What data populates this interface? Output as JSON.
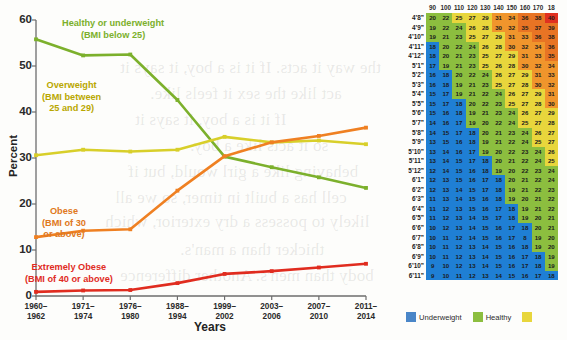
{
  "chart_data": {
    "type": "line",
    "title": "",
    "xlabel": "Years",
    "ylabel": "Percent",
    "ylim": [
      0,
      60
    ],
    "yticks": [
      0,
      10,
      20,
      30,
      40,
      50,
      60
    ],
    "grid": false,
    "legend_position": "inline-annotations",
    "categories": [
      "1960–1962",
      "1971–1974",
      "1976–1980",
      "1988–1994",
      "1999–2002",
      "2003–2006",
      "2007–2010",
      "2011–2014"
    ],
    "series": [
      {
        "name": "Healthy or underweight",
        "annotation": "Healthy or underweight",
        "annotation_sub": "(BMI below 25)",
        "color": "#7cb02c",
        "values": [
          55.8,
          52.3,
          52.5,
          42.6,
          30.3,
          28.0,
          25.8,
          23.5
        ]
      },
      {
        "name": "Overweight",
        "annotation": "Overweight",
        "annotation_sub": "(BMI between\n25 and 29)",
        "color": "#d8cf2a",
        "values": [
          30.6,
          31.8,
          31.4,
          31.8,
          34.6,
          33.4,
          33.8,
          33.0
        ]
      },
      {
        "name": "Obese",
        "annotation": "Obese",
        "annotation_sub": "(BMI of 30\nor above)",
        "color": "#ef8022",
        "values": [
          12.8,
          14.2,
          14.5,
          22.9,
          30.4,
          33.4,
          34.8,
          36.6
        ]
      },
      {
        "name": "Extremely Obese",
        "annotation": "Extremely Obese",
        "annotation_sub": "(BMI of 40 or above)",
        "color": "#e02c1f",
        "values": [
          0.9,
          1.2,
          1.3,
          2.8,
          4.8,
          5.4,
          6.2,
          7.0
        ]
      }
    ]
  },
  "chart": {
    "y_axis_title": "Percent",
    "x_axis_title": "Years",
    "y_tick_labels": [
      "60",
      "50",
      "40",
      "30",
      "20",
      "10",
      "0"
    ],
    "x_tick_labels": [
      [
        "1960–",
        "1962"
      ],
      [
        "1971–",
        "1974"
      ],
      [
        "1976–",
        "1980"
      ],
      [
        "1988–",
        "1994"
      ],
      [
        "1999–",
        "2002"
      ],
      [
        "2003–",
        "2006"
      ],
      [
        "2007–",
        "2010"
      ],
      [
        "2011–",
        "2014"
      ]
    ]
  },
  "bmi_table": {
    "axis_title": "Height in feet and inches",
    "weight_headers": [
      "90",
      "100",
      "110",
      "120",
      "130",
      "140",
      "150",
      "160",
      "170",
      "18"
    ],
    "rows": [
      {
        "height": "4’8”",
        "values": [
          20,
          22,
          25,
          27,
          29,
          31,
          34,
          36,
          38,
          40
        ]
      },
      {
        "height": "4’9”",
        "values": [
          19,
          22,
          24,
          26,
          28,
          30,
          32,
          35,
          37,
          39
        ]
      },
      {
        "height": "4’10”",
        "values": [
          19,
          21,
          23,
          25,
          27,
          29,
          31,
          33,
          36,
          38
        ]
      },
      {
        "height": "4’11”",
        "values": [
          18,
          20,
          22,
          24,
          26,
          28,
          30,
          32,
          34,
          36
        ]
      },
      {
        "height": "4’12”",
        "values": [
          18,
          20,
          21,
          23,
          25,
          27,
          29,
          31,
          33,
          35
        ]
      },
      {
        "height": "5’1”",
        "values": [
          17,
          19,
          21,
          23,
          25,
          26,
          28,
          30,
          32,
          34
        ]
      },
      {
        "height": "5’2”",
        "values": [
          16,
          18,
          20,
          22,
          24,
          26,
          27,
          29,
          31,
          33
        ]
      },
      {
        "height": "5’3”",
        "values": [
          16,
          18,
          19,
          21,
          23,
          25,
          27,
          28,
          30,
          32
        ]
      },
      {
        "height": "5’4”",
        "values": [
          15,
          17,
          19,
          21,
          22,
          24,
          26,
          27,
          29,
          31
        ]
      },
      {
        "height": "5’5”",
        "values": [
          15,
          17,
          18,
          20,
          22,
          23,
          25,
          27,
          28,
          30
        ]
      },
      {
        "height": "5’6”",
        "values": [
          15,
          16,
          18,
          19,
          21,
          23,
          24,
          26,
          27,
          29
        ]
      },
      {
        "height": "5’7”",
        "values": [
          14,
          16,
          17,
          19,
          20,
          22,
          24,
          25,
          27,
          28
        ]
      },
      {
        "height": "5’8”",
        "values": [
          14,
          15,
          17,
          18,
          20,
          21,
          23,
          24,
          26,
          27
        ]
      },
      {
        "height": "5’9”",
        "values": [
          13,
          15,
          16,
          18,
          19,
          21,
          22,
          24,
          25,
          27
        ]
      },
      {
        "height": "5’10”",
        "values": [
          13,
          14,
          16,
          17,
          19,
          20,
          22,
          23,
          24,
          26
        ]
      },
      {
        "height": "5’11”",
        "values": [
          13,
          14,
          15,
          17,
          18,
          20,
          21,
          22,
          24,
          25
        ]
      },
      {
        "height": "5’12”",
        "values": [
          12,
          14,
          15,
          16,
          18,
          19,
          20,
          22,
          23,
          24
        ]
      },
      {
        "height": "6’1”",
        "values": [
          12,
          13,
          15,
          16,
          17,
          18,
          20,
          21,
          22,
          24
        ]
      },
      {
        "height": "6’2”",
        "values": [
          12,
          13,
          14,
          15,
          17,
          18,
          19,
          21,
          22,
          23
        ]
      },
      {
        "height": "6’3”",
        "values": [
          11,
          13,
          14,
          15,
          16,
          18,
          19,
          20,
          21,
          22
        ]
      },
      {
        "height": "6’4”",
        "values": [
          11,
          12,
          13,
          15,
          16,
          17,
          18,
          19,
          21,
          22
        ]
      },
      {
        "height": "6’5”",
        "values": [
          11,
          12,
          13,
          14,
          15,
          17,
          18,
          19,
          20,
          21
        ]
      },
      {
        "height": "6’6”",
        "values": [
          10,
          12,
          13,
          14,
          15,
          16,
          17,
          18,
          20,
          21
        ]
      },
      {
        "height": "6’7”",
        "values": [
          10,
          11,
          12,
          14,
          15,
          16,
          17,
          8,
          19,
          20
        ]
      },
      {
        "height": "6’8”",
        "values": [
          10,
          11,
          12,
          13,
          14,
          15,
          16,
          18,
          19,
          20
        ]
      },
      {
        "height": "6’9”",
        "values": [
          10,
          11,
          12,
          13,
          14,
          15,
          16,
          17,
          18,
          19
        ]
      },
      {
        "height": "6’10”",
        "values": [
          9,
          10,
          12,
          13,
          14,
          15,
          16,
          17,
          18,
          19
        ]
      },
      {
        "height": "6’11”",
        "values": [
          9,
          10,
          11,
          12,
          13,
          14,
          15,
          16,
          17,
          18
        ]
      }
    ],
    "legend": [
      {
        "label": "Underweight",
        "color": "#4a86c8"
      },
      {
        "label": "Healthy",
        "color": "#8cbe3f"
      },
      {
        "label": "",
        "color": "#e8d63c"
      }
    ]
  },
  "bleed_text": {
    "l1": "the way it acts. If it is a boy, it says it",
    "l2": "act like the sex it feels like.",
    "l3": "If it is a boy, it says it",
    "l4": "so it acts like a boy.",
    "l5": "behaving like a girl would, but if",
    "l6": "cell has a built in timer, so we all",
    "l7": "likely to possess a dry exterior, which",
    "l8": "thicker than a man's.",
    "l9": "body than men's. Another difference"
  }
}
